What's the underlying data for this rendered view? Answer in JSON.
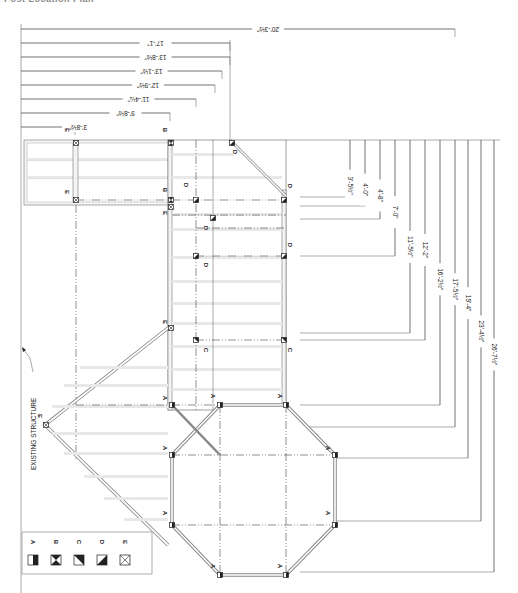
{
  "title": "Post Location Plan",
  "label_existing": "EXISTING STRUCTURE",
  "top_dimensions": [
    {
      "label": "20'-3½\"",
      "y": 29,
      "x_end": 455
    },
    {
      "label": "17'-1\"",
      "y": 43,
      "x_end": 230
    },
    {
      "label": "13'-8½\"",
      "y": 57,
      "x_end": 230
    },
    {
      "label": "13'-1½\"",
      "y": 71,
      "x_end": 222
    },
    {
      "label": "12'-9½\"",
      "y": 85,
      "x_end": 215
    },
    {
      "label": "11'-4¼\"",
      "y": 99,
      "x_end": 196
    },
    {
      "label": "9'-8½\"",
      "y": 113,
      "x_end": 170
    },
    {
      "label": "3'-8½\"",
      "y": 127,
      "x_end": 75
    }
  ],
  "right_dimensions": [
    {
      "label": "3'-5½\"",
      "x": 350,
      "y_end": 197
    },
    {
      "label": "4'-0\"",
      "x": 365,
      "y_end": 206
    },
    {
      "label": "4'-8\"",
      "x": 380,
      "y_end": 219
    },
    {
      "label": "7'-0\"",
      "x": 395,
      "y_end": 256
    },
    {
      "label": "11'-5½\"",
      "x": 410,
      "y_end": 333
    },
    {
      "label": "12'-2\"",
      "x": 425,
      "y_end": 340
    },
    {
      "label": "16'-2½\"",
      "x": 440,
      "y_end": 405
    },
    {
      "label": "17'-5½\"",
      "x": 455,
      "y_end": 427
    },
    {
      "label": "19'-4\"",
      "x": 468,
      "y_end": 458
    },
    {
      "label": "23'-4½\"",
      "x": 481,
      "y_end": 521
    },
    {
      "label": "26'-7½\"",
      "x": 494,
      "y_end": 572
    }
  ],
  "post_tags": {
    "A": "A",
    "B": "B",
    "C": "C",
    "D": "D",
    "E": "E"
  },
  "legend": [
    {
      "key": "A",
      "symbol": "half-filled-box"
    },
    {
      "key": "B",
      "symbol": "hourglass-box"
    },
    {
      "key": "C",
      "symbol": "triangle-upper-right-box"
    },
    {
      "key": "D",
      "symbol": "triangle-lower-right-box"
    },
    {
      "key": "E",
      "symbol": "x-box"
    }
  ],
  "colors": {
    "line": "#333333",
    "beam": "#f4f4f4",
    "post": "#222222"
  }
}
